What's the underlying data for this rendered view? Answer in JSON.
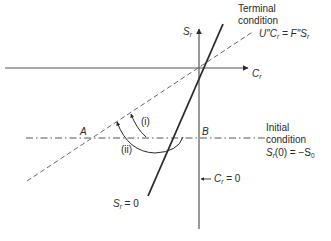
{
  "diagram": {
    "axes": {
      "x_label": "C",
      "x_label_sub": "r",
      "y_label": "S",
      "y_label_sub": "r"
    },
    "terminal_condition": {
      "title_line1": "Terminal",
      "title_line2": "condition",
      "equation_left": "U″C",
      "equation_left_sub": "r",
      "equation_eq": " = F″S",
      "equation_right_sub": "r"
    },
    "initial_condition": {
      "title_line1": "Initial",
      "title_line2": "condition",
      "equation_s": "S",
      "equation_sub": "r",
      "equation_rest": "(0) = −S",
      "equation_rest_sub": "0"
    },
    "points": {
      "A": "A",
      "B": "B"
    },
    "arcs": {
      "i": "(i)",
      "ii": "(ii)"
    },
    "line_labels": {
      "sr_zero_s": "S",
      "sr_zero_sub": "r",
      "sr_zero_rest": " = 0",
      "cr_zero_c": "C",
      "cr_zero_sub": "r",
      "cr_zero_rest": " = 0"
    },
    "colors": {
      "ink": "#2a2a2a",
      "axis": "#555555",
      "dashed": "#666666"
    }
  }
}
